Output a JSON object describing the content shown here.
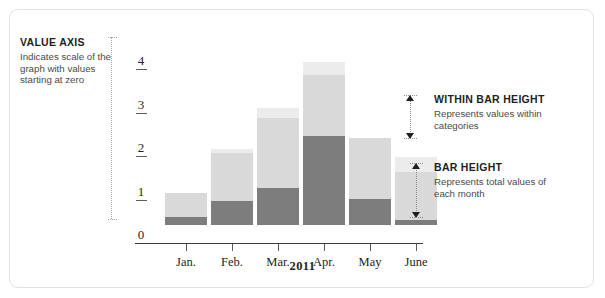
{
  "figure": {
    "frame_color": "#e2e2e2",
    "background": "#ffffff"
  },
  "annotations": {
    "value_axis": {
      "title": "VALUE AXIS",
      "body": "Indicates scale of the graph with values starting at zero"
    },
    "within_bar_height": {
      "title": "WITHIN BAR HEIGHT",
      "body": "Represents values within categories"
    },
    "bar_height": {
      "title": "BAR HEIGHT",
      "body": "Represents total values of each month"
    }
  },
  "chart_data": {
    "type": "bar",
    "stacked": true,
    "title": "",
    "xlabel": "2011",
    "ylabel": "",
    "ylim": [
      0,
      4
    ],
    "yticks": [
      "4",
      "3",
      "2",
      "1",
      "0"
    ],
    "ytick_values": [
      4,
      3,
      2,
      1,
      0
    ],
    "grid": false,
    "legend": "none",
    "categories": [
      "Jan.",
      "Feb.",
      "Mar.",
      "Apr.",
      "May",
      "June"
    ],
    "series": [
      {
        "name": "lower",
        "color": "#7d7d7d",
        "values": [
          0.18,
          0.55,
          0.85,
          2.05,
          0.6,
          0.12
        ]
      },
      {
        "name": "upper",
        "color": "#d9d9d9",
        "values": [
          0.55,
          1.1,
          1.6,
          1.4,
          1.4,
          1.1
        ]
      },
      {
        "name": "top",
        "color": "#ececec",
        "values": [
          0.0,
          0.1,
          0.25,
          0.3,
          0.0,
          0.35
        ]
      }
    ],
    "totals": [
      0.73,
      1.75,
      2.7,
      3.75,
      2.0,
      1.57
    ],
    "colors": {
      "lower": "#7d7d7d",
      "upper": "#d9d9d9",
      "top": "#ececec",
      "axis": "#3b3b3b",
      "text": "#231f20"
    }
  }
}
